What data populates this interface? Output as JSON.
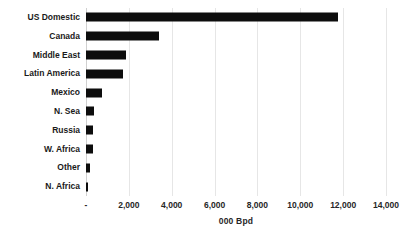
{
  "chart_data": {
    "type": "bar",
    "orientation": "horizontal",
    "title": "",
    "xlabel": "000 Bpd",
    "ylabel": "",
    "xlim": [
      0,
      14000
    ],
    "xticks": [
      0,
      2000,
      4000,
      6000,
      8000,
      10000,
      12000,
      14000
    ],
    "xtick_labels": [
      "-",
      "2,000",
      "4,000",
      "6,000",
      "8,000",
      "10,000",
      "12,000",
      "14,000"
    ],
    "grid": true,
    "grid_axis": "x",
    "legend": false,
    "bar_color": "#0d0d0d",
    "grid_color": "#e6e6e6",
    "background": "#ffffff",
    "categories": [
      "US Domestic",
      "Canada",
      "Middle East",
      "Latin America",
      "Mexico",
      "N. Sea",
      "Russia",
      "W. Africa",
      "Other",
      "N. Africa"
    ],
    "values": [
      11750,
      3390,
      1880,
      1740,
      760,
      380,
      330,
      320,
      190,
      100
    ],
    "series": [
      {
        "name": "000 Bpd",
        "values": [
          11750,
          3390,
          1880,
          1740,
          760,
          380,
          330,
          320,
          190,
          100
        ]
      }
    ]
  }
}
